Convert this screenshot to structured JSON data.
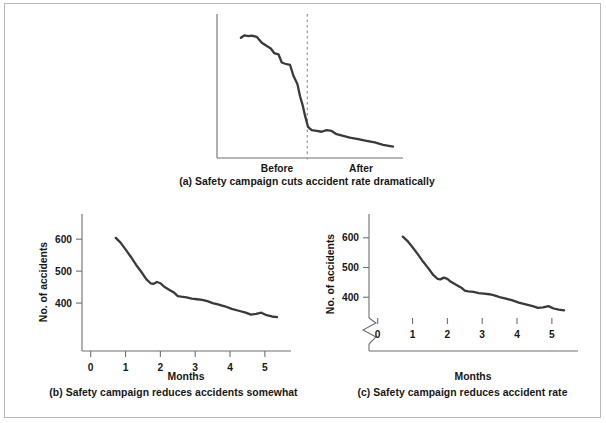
{
  "figure": {
    "border_color": "#b9b9b9",
    "background": "#ffffff",
    "line_color": "#3a3a3a",
    "axis_color": "#6f6f6f"
  },
  "panels": {
    "a": {
      "caption": "(a) Safety campaign cuts accident rate dramatically",
      "xlabel_before": "Before",
      "xlabel_after": "After",
      "divider_label": "campaign-start-divider"
    },
    "b": {
      "caption": "(b) Safety campaign reduces accidents somewhat",
      "xlabel": "Months",
      "ylabel": "No. of accidents"
    },
    "c": {
      "caption": "(c) Safety campaign reduces accident rate",
      "xlabel": "Months",
      "ylabel": "No. of accidents",
      "axis_break": "zigzag-break"
    }
  },
  "chart_data": [
    {
      "id": "a",
      "type": "line",
      "title": "(a) Safety campaign cuts accident rate dramatically",
      "xlabel": "",
      "ylabel": "",
      "xtick_labels": [
        "Before",
        "After"
      ],
      "ytick_labels": [],
      "grid": false,
      "legend": "none",
      "xlim": [
        0,
        5.6
      ],
      "ylim": [
        330,
        660
      ],
      "annotations": [
        {
          "type": "vertical-dashed-line",
          "x": 2.72,
          "label": "campaign start"
        }
      ],
      "x": [
        0.72,
        0.82,
        0.95,
        1.05,
        1.2,
        1.35,
        1.5,
        1.62,
        1.72,
        1.85,
        1.95,
        2.05,
        2.2,
        2.3,
        2.42,
        2.5,
        2.58,
        2.66,
        2.74,
        2.85,
        3.0,
        3.15,
        3.3,
        3.45,
        3.6,
        3.8,
        4.0,
        4.25,
        4.5,
        4.75,
        5.0,
        5.3
      ],
      "y": [
        612,
        618,
        616,
        617,
        614,
        600,
        592,
        586,
        575,
        572,
        552,
        549,
        546,
        520,
        500,
        470,
        448,
        420,
        396,
        388,
        386,
        384,
        388,
        386,
        378,
        374,
        370,
        366,
        362,
        358,
        352,
        348
      ]
    },
    {
      "id": "b",
      "type": "line",
      "title": "(b) Safety campaign reduces accidents somewhat",
      "xlabel": "Months",
      "ylabel": "No. of accidents",
      "xtick_labels": [
        "0",
        "1",
        "2",
        "3",
        "4",
        "5"
      ],
      "xticks": [
        0,
        1,
        2,
        3,
        4,
        5
      ],
      "ytick_labels": [
        "400",
        "500",
        "600"
      ],
      "yticks": [
        400,
        500,
        600
      ],
      "grid": false,
      "legend": "none",
      "xlim": [
        -0.25,
        5.75
      ],
      "ylim": [
        250,
        660
      ],
      "axis_break": false,
      "x": [
        0.72,
        0.85,
        1.0,
        1.15,
        1.3,
        1.45,
        1.6,
        1.72,
        1.8,
        1.9,
        2.0,
        2.1,
        2.25,
        2.4,
        2.5,
        2.6,
        2.75,
        2.9,
        3.05,
        3.2,
        3.35,
        3.5,
        3.65,
        3.85,
        4.05,
        4.25,
        4.45,
        4.6,
        4.75,
        4.9,
        5.05,
        5.2,
        5.35
      ],
      "y": [
        604,
        590,
        568,
        545,
        520,
        498,
        474,
        462,
        460,
        466,
        462,
        452,
        442,
        432,
        422,
        420,
        418,
        414,
        412,
        410,
        406,
        400,
        396,
        390,
        382,
        376,
        370,
        364,
        366,
        370,
        362,
        358,
        356
      ]
    },
    {
      "id": "c",
      "type": "line",
      "title": "(c) Safety campaign reduces accident rate",
      "xlabel": "Months",
      "ylabel": "No. of accidents",
      "xtick_labels": [
        "0",
        "1",
        "2",
        "3",
        "4",
        "5"
      ],
      "xticks": [
        0,
        1,
        2,
        3,
        4,
        5
      ],
      "ytick_labels": [
        "400",
        "500",
        "600"
      ],
      "yticks": [
        400,
        500,
        600
      ],
      "grid": false,
      "legend": "none",
      "xlim": [
        -0.25,
        5.75
      ],
      "ylim": [
        330,
        660
      ],
      "axis_break": true,
      "axis_break_at": 400,
      "x": [
        0.72,
        0.85,
        1.0,
        1.15,
        1.3,
        1.45,
        1.6,
        1.72,
        1.8,
        1.9,
        2.0,
        2.1,
        2.25,
        2.4,
        2.5,
        2.6,
        2.75,
        2.9,
        3.05,
        3.2,
        3.35,
        3.5,
        3.65,
        3.85,
        4.05,
        4.25,
        4.45,
        4.6,
        4.75,
        4.9,
        5.05,
        5.2,
        5.35
      ],
      "y": [
        604,
        590,
        568,
        545,
        520,
        498,
        474,
        462,
        460,
        466,
        462,
        452,
        442,
        432,
        422,
        420,
        418,
        414,
        412,
        410,
        406,
        400,
        396,
        390,
        382,
        376,
        370,
        364,
        366,
        370,
        362,
        358,
        356
      ]
    }
  ]
}
